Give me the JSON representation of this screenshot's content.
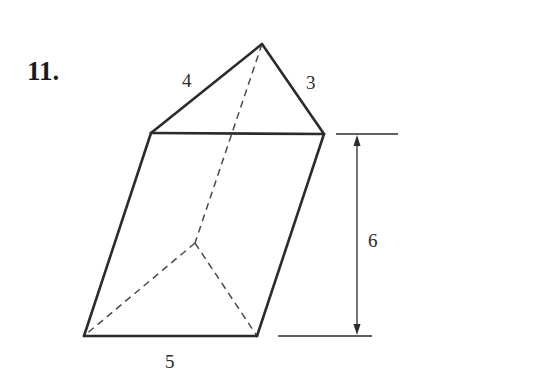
{
  "problem": {
    "number": "11."
  },
  "figure": {
    "type": "oblique triangular prism",
    "labels": {
      "edge_top_left": "4",
      "edge_top_right": "3",
      "edge_bottom_front": "5",
      "height": "6"
    },
    "colors": {
      "stroke": "#2b2b2b",
      "hidden_stroke": "#4a4a4a",
      "background": "#ffffff"
    }
  }
}
